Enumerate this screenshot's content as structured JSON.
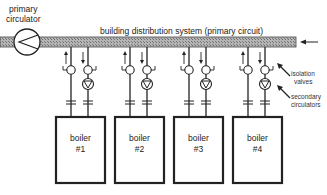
{
  "diagram": {
    "primary_circulator_label": [
      "primary",
      "circulator"
    ],
    "primary_circuit_label": "building distribution system (primary circuit)",
    "isolation_valves_label": [
      "isolation",
      "valves"
    ],
    "secondary_circulators_label": [
      "secondary",
      "circulators"
    ],
    "boilers": [
      {
        "name": "boiler",
        "number": "#1"
      },
      {
        "name": "boiler",
        "number": "#2"
      },
      {
        "name": "boiler",
        "number": "#3"
      },
      {
        "name": "boiler",
        "number": "#4"
      }
    ],
    "colors": {
      "pipe_fill": "#9a9a9a",
      "line": "#222222",
      "background": "#ffffff"
    }
  }
}
